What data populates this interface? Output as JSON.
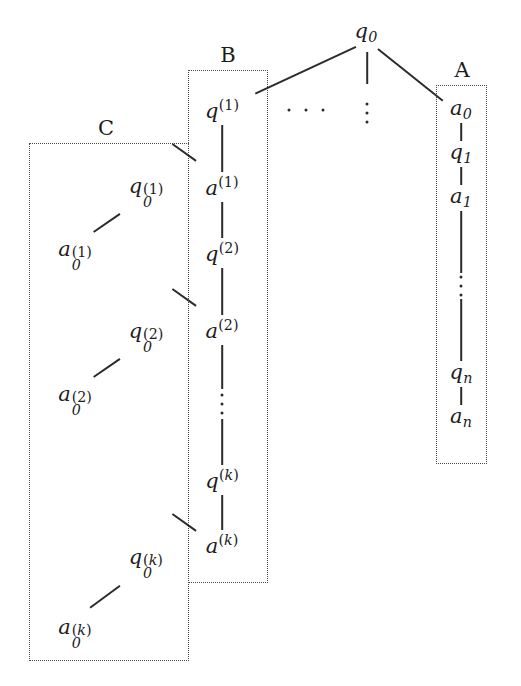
{
  "figure": {
    "background": "#ffffff",
    "ink_color": "#1c1c1c",
    "stroke_color": "#2b2b2b",
    "box_border_color": "#4a4a4a"
  },
  "root": {
    "label": "q",
    "subscript": "0",
    "x": 366,
    "y": 33
  },
  "group_labels": {
    "a": "A",
    "b": "B",
    "c": "C"
  },
  "boxes": [
    {
      "id": "box-c",
      "label": "C",
      "x": 29,
      "y": 143,
      "w": 160,
      "h": 518,
      "label_x": 106,
      "label_y": 140
    },
    {
      "id": "box-b",
      "label": "B",
      "x": 188,
      "y": 70,
      "w": 80,
      "h": 513,
      "label_x": 228,
      "label_y": 67
    },
    {
      "id": "box-a",
      "label": "A",
      "x": 436,
      "y": 85,
      "w": 51,
      "h": 379,
      "label_x": 462,
      "label_y": 82
    }
  ],
  "columns": {
    "a": {
      "name": "A",
      "x": 461,
      "nodes": [
        {
          "base": "a",
          "sub": "0",
          "y": 110,
          "kind": "sub"
        },
        {
          "base": "q",
          "sub": "1",
          "y": 154,
          "kind": "sub"
        },
        {
          "base": "a",
          "sub": "1",
          "y": 198,
          "kind": "sub"
        },
        {
          "base": "",
          "sub": "",
          "y": 286,
          "kind": "vdots"
        },
        {
          "base": "q",
          "sub": "n",
          "y": 374,
          "kind": "sub"
        },
        {
          "base": "a",
          "sub": "n",
          "y": 418,
          "kind": "sub"
        }
      ]
    },
    "b": {
      "name": "B",
      "x": 222,
      "nodes": [
        {
          "base": "q",
          "sup": "(1)",
          "y": 110,
          "kind": "sup"
        },
        {
          "base": "a",
          "sup": "(1)",
          "y": 187,
          "kind": "sup"
        },
        {
          "base": "q",
          "sup": "(2)",
          "y": 253,
          "kind": "sup"
        },
        {
          "base": "a",
          "sup": "(2)",
          "y": 330,
          "kind": "sup"
        },
        {
          "base": "",
          "sup": "",
          "y": 404,
          "kind": "vdots"
        },
        {
          "base": "q",
          "sup": "(k)",
          "y": 480,
          "kind": "sup"
        },
        {
          "base": "a",
          "sup": "(k)",
          "y": 545,
          "kind": "sup"
        }
      ]
    },
    "c": {
      "name": "C",
      "pairs": [
        {
          "q": {
            "base": "q",
            "sub": "0",
            "sup": "(1)",
            "x": 141,
            "y": 186
          },
          "a": {
            "base": "a",
            "sub": "0",
            "sup": "(1)",
            "x": 70,
            "y": 249
          }
        },
        {
          "q": {
            "base": "q",
            "sub": "0",
            "sup": "(2)",
            "x": 141,
            "y": 331
          },
          "a": {
            "base": "a",
            "sub": "0",
            "sup": "(2)",
            "x": 70,
            "y": 394
          }
        },
        {
          "q": {
            "base": "q",
            "sub": "0",
            "sup": "(k)",
            "x": 141,
            "y": 557
          },
          "a": {
            "base": "a",
            "sub": "0",
            "sup": "(k)",
            "x": 70,
            "y": 627
          }
        }
      ]
    }
  },
  "ellipses": [
    {
      "id": "branch-ellipsis-horizontal",
      "type": "horizontal",
      "x": 306,
      "y": 110
    },
    {
      "id": "branch-ellipsis-vertical",
      "type": "vertical",
      "x": 367,
      "y": 113
    },
    {
      "id": "column-a-ellipsis",
      "type": "vertical",
      "x": 461,
      "y": 286
    },
    {
      "id": "column-b-ellipsis",
      "type": "vertical",
      "x": 222,
      "y": 404
    }
  ],
  "edges": {
    "root_to_b": {
      "x1": 356,
      "y1": 46,
      "x2": 255,
      "y2": 93
    },
    "root_stem": {
      "x": 367,
      "y1": 52,
      "y2": 84
    },
    "root_to_a": {
      "x1": 378,
      "y1": 48,
      "x2": 443,
      "y2": 100
    },
    "b_connectors": [
      {
        "x1": 196,
        "y1": 160,
        "x2": 172,
        "y2": 143
      },
      {
        "x1": 196,
        "y1": 305,
        "x2": 172,
        "y2": 288
      },
      {
        "x1": 196,
        "y1": 530,
        "x2": 172,
        "y2": 513
      }
    ],
    "c_connectors": [
      {
        "x1": 120,
        "y1": 213,
        "x2": 94,
        "y2": 231
      },
      {
        "x1": 120,
        "y1": 358,
        "x2": 94,
        "y2": 376
      },
      {
        "x1": 120,
        "y1": 585,
        "x2": 90,
        "y2": 607
      }
    ]
  }
}
